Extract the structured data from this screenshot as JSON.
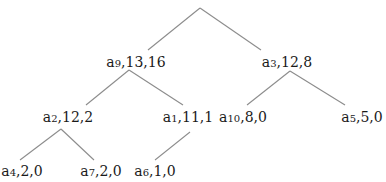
{
  "diagram": {
    "type": "tree",
    "root": {
      "label": "",
      "x": 200,
      "y": 8
    },
    "nodes": [
      {
        "id": "a9",
        "name": "a",
        "sub": "9",
        "values": ",13,16",
        "x": 136,
        "y": 54
      },
      {
        "id": "a3",
        "name": "a",
        "sub": "3",
        "values": ",12,8",
        "x": 287,
        "y": 54
      },
      {
        "id": "a2",
        "name": "a",
        "sub": "2",
        "values": ",12,2",
        "x": 68,
        "y": 109
      },
      {
        "id": "a1",
        "name": "a",
        "sub": "1",
        "values": ",11,1",
        "x": 188,
        "y": 109
      },
      {
        "id": "a10",
        "name": "a",
        "sub": "10",
        "values": ",8,0",
        "x": 243,
        "y": 109
      },
      {
        "id": "a5",
        "name": "a",
        "sub": "5",
        "values": ",5,0",
        "x": 362,
        "y": 109
      },
      {
        "id": "a4",
        "name": "a",
        "sub": "4",
        "values": ",2,0",
        "x": 22,
        "y": 163
      },
      {
        "id": "a7",
        "name": "a",
        "sub": "7",
        "values": ",2,0",
        "x": 101,
        "y": 163
      },
      {
        "id": "a6",
        "name": "a",
        "sub": "6",
        "values": ",1,0",
        "x": 155,
        "y": 163
      }
    ],
    "edges": [
      {
        "from": "root",
        "to": "a9",
        "x1": 200,
        "y1": 8,
        "x2": 148,
        "y2": 50
      },
      {
        "from": "root",
        "to": "a3",
        "x1": 200,
        "y1": 8,
        "x2": 261,
        "y2": 50
      },
      {
        "from": "a9",
        "to": "a2",
        "x1": 129,
        "y1": 70,
        "x2": 86,
        "y2": 105
      },
      {
        "from": "a9",
        "to": "a1",
        "x1": 129,
        "y1": 70,
        "x2": 183,
        "y2": 105
      },
      {
        "from": "a3",
        "to": "a10",
        "x1": 290,
        "y1": 71,
        "x2": 247,
        "y2": 105
      },
      {
        "from": "a3",
        "to": "a5",
        "x1": 290,
        "y1": 71,
        "x2": 345,
        "y2": 105
      },
      {
        "from": "a2",
        "to": "a4",
        "x1": 61,
        "y1": 129,
        "x2": 20,
        "y2": 160
      },
      {
        "from": "a2",
        "to": "a7",
        "x1": 61,
        "y1": 129,
        "x2": 94,
        "y2": 160
      },
      {
        "from": "a1",
        "to": "a6",
        "x1": 190,
        "y1": 132,
        "x2": 155,
        "y2": 160
      }
    ]
  },
  "labels": {
    "a9": {
      "name": "a",
      "sub": "9",
      "values": ",13,16"
    },
    "a3": {
      "name": "a",
      "sub": "3",
      "values": ",12,8"
    },
    "a2": {
      "name": "a",
      "sub": "2",
      "values": ",12,2"
    },
    "a1": {
      "name": "a",
      "sub": "1",
      "values": ",11,1"
    },
    "a10": {
      "name": "a",
      "sub": "10",
      "values": ",8,0"
    },
    "a5": {
      "name": "a",
      "sub": "5",
      "values": ",5,0"
    },
    "a4": {
      "name": "a",
      "sub": "4",
      "values": ",2,0"
    },
    "a7": {
      "name": "a",
      "sub": "7",
      "values": ",2,0"
    },
    "a6": {
      "name": "a",
      "sub": "6",
      "values": ",1,0"
    }
  }
}
